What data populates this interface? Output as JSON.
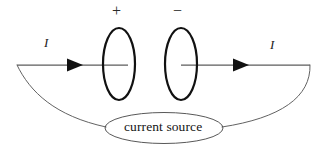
{
  "figure": {
    "type": "circuit-diagram",
    "background_color": "#ffffff",
    "stroke_color": "#1a1a1a",
    "thin_stroke_color": "#4a4a4a",
    "wire_color": "#555555"
  },
  "labels": {
    "plate_positive": "+",
    "plate_negative": "−",
    "current_left": "I",
    "current_right": "I",
    "source": "current source"
  },
  "components": {
    "left_plate": {
      "name": "capacitor-plate-positive",
      "shape": "ellipse",
      "cx": 119,
      "cy": 64,
      "rx": 16,
      "ry": 36,
      "stroke_width": 2.2,
      "sign": "+"
    },
    "right_plate": {
      "name": "capacitor-plate-negative",
      "shape": "ellipse",
      "cx": 181,
      "cy": 64,
      "rx": 16,
      "ry": 36,
      "stroke_width": 2.2,
      "sign": "−"
    },
    "source_ellipse": {
      "name": "current-source-body",
      "shape": "ellipse",
      "cx": 164,
      "cy": 128,
      "rx": 59,
      "ry": 15.5,
      "stroke_width": 0.9
    }
  },
  "wires": {
    "left_lead": {
      "x1": 17,
      "y1": 65,
      "x2": 128,
      "y2": 65,
      "stroke_width": 1.2
    },
    "right_lead": {
      "x1": 181,
      "y1": 65,
      "x2": 310,
      "y2": 65,
      "stroke_width": 1.2
    },
    "left_return_path": "M 17 65 C 30 92 55 116 106 127",
    "right_return_path": "M 310 65 C 310 96 280 118 222 127"
  },
  "arrows": [
    {
      "name": "current-arrow-left",
      "tip_x": 83,
      "base_x": 67,
      "y": 65,
      "half_height": 6.5
    },
    {
      "name": "current-arrow-right",
      "tip_x": 249,
      "base_x": 233,
      "y": 65,
      "half_height": 6.5
    }
  ]
}
